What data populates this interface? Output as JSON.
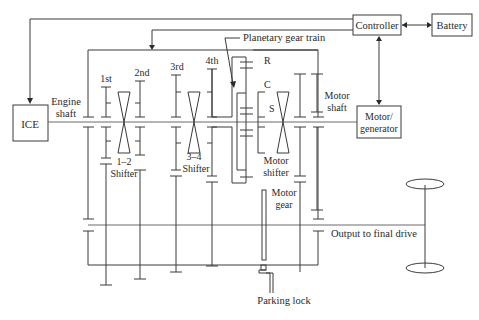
{
  "diagram": {
    "blocks": {
      "ice": "ICE",
      "controller": "Controller",
      "battery": "Battery",
      "motor_generator_line1": "Motor/",
      "motor_generator_line2": "generator"
    },
    "labels": {
      "engine_shaft_1": "Engine",
      "engine_shaft_2": "shaft",
      "gear_1st": "1st",
      "gear_2nd": "2nd",
      "gear_3rd": "3rd",
      "gear_4th": "4th",
      "shifter_12_line1": "1–2",
      "shifter_12_line2": "Shifter",
      "shifter_34_line1": "3–4",
      "shifter_34_line2": "Shifter",
      "planetary": "Planetary gear train",
      "ring": "R",
      "carrier": "C",
      "sun": "S",
      "motor_shaft_1": "Motor",
      "motor_shaft_2": "shaft",
      "motor_shifter_1": "Motor",
      "motor_shifter_2": "shifter",
      "motor_gear_1": "Motor",
      "motor_gear_2": "gear",
      "output": "Output to final drive",
      "parking_lock": "Parking lock"
    },
    "connections": [
      {
        "from": "Controller",
        "to": "ICE",
        "type": "one-way"
      },
      {
        "from": "Controller",
        "to": "Transmission housing",
        "type": "one-way"
      },
      {
        "from": "Controller",
        "to": "Battery",
        "type": "two-way"
      },
      {
        "from": "Controller",
        "to": "Motor/generator",
        "type": "two-way"
      }
    ]
  }
}
